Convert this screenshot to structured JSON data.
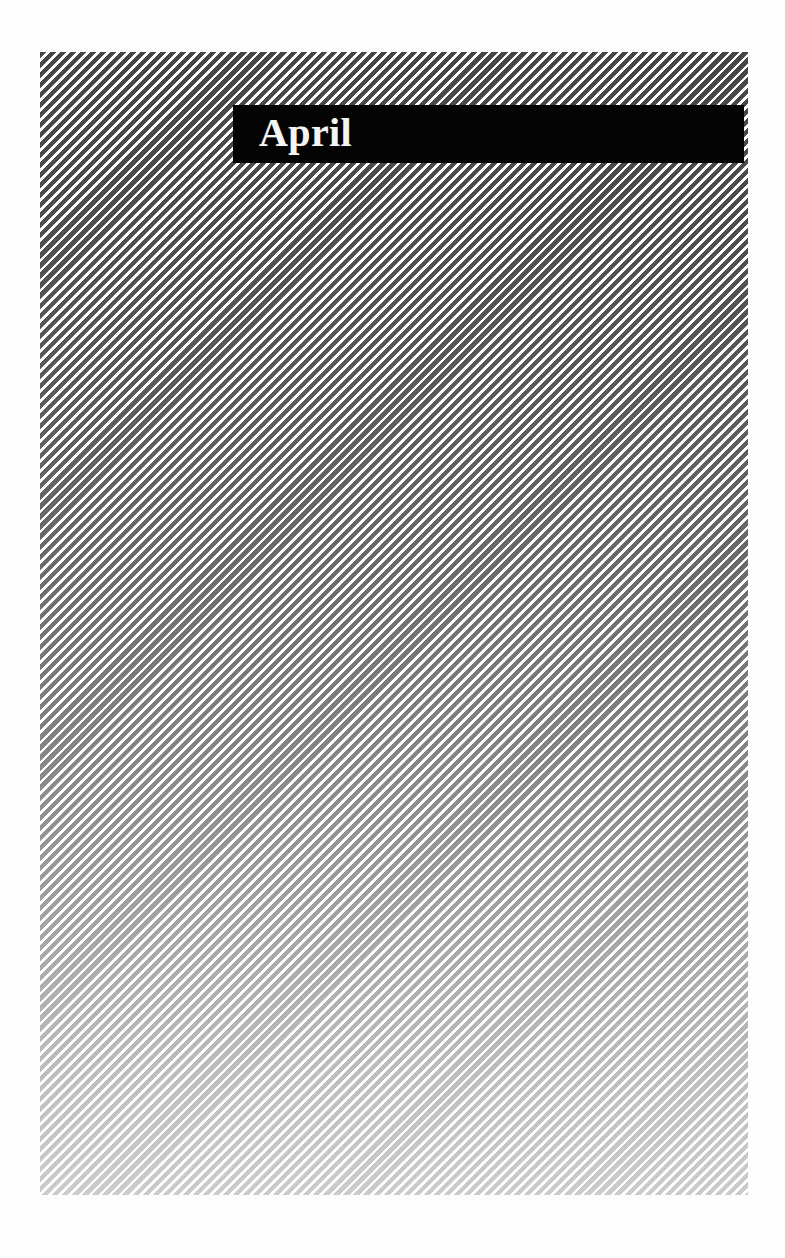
{
  "page": {
    "background_color": "#fdfdfd",
    "width": 785,
    "height": 1258
  },
  "title_band": {
    "label": "April",
    "background_color": "#040404",
    "text_color": "#f4f4f2"
  },
  "hatch_panel": {
    "name": "diagonal-hatch-panel",
    "stripe_color": "#3f3f3f",
    "gap_color": "#ffffff",
    "stripe_angle_degrees": 135,
    "stripe_period_px": 7.1,
    "fade_direction": "top-dark-to-bottom-light"
  }
}
